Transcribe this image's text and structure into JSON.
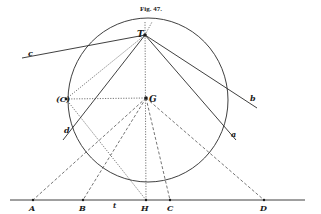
{
  "figure": {
    "title": "Fig. 47.",
    "circle": {
      "cx": 148,
      "cy": 100,
      "rx": 79,
      "ry": 82
    },
    "points": {
      "T": {
        "label": "T",
        "x": 145,
        "y": 35
      },
      "G": {
        "label": "G",
        "x": 146,
        "y": 98
      },
      "C_paren": {
        "label": "(C)",
        "x": 66,
        "y": 99
      },
      "A": {
        "label": "A",
        "x": 33,
        "y": 200
      },
      "B": {
        "label": "B",
        "x": 83,
        "y": 200
      },
      "H": {
        "label": "H",
        "x": 146,
        "y": 200
      },
      "C": {
        "label": "C",
        "x": 170,
        "y": 200
      },
      "D": {
        "label": "D",
        "x": 264,
        "y": 200
      }
    },
    "line_labels": {
      "c": "c",
      "b": "b",
      "d": "d",
      "a": "a",
      "t": "t"
    },
    "ground_line": {
      "x1": 10,
      "x2": 305,
      "y": 200
    }
  }
}
